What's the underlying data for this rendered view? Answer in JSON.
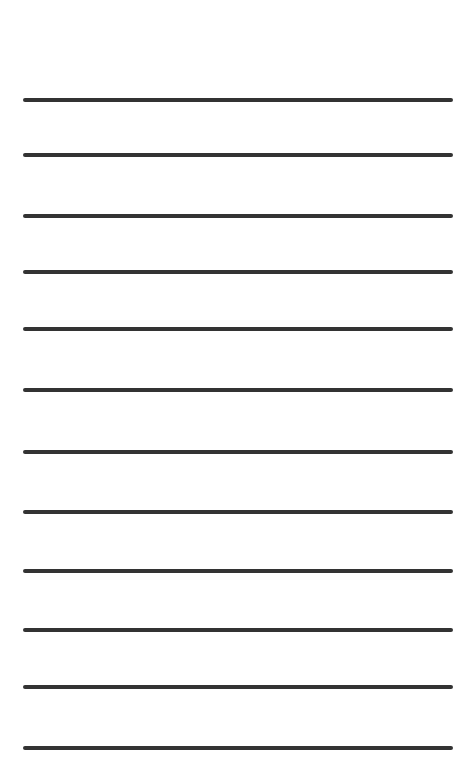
{
  "page": {
    "type": "lined-paper",
    "line_color": "#333333",
    "background_color": "#ffffff",
    "lines": [
      {
        "y": 98
      },
      {
        "y": 153
      },
      {
        "y": 214
      },
      {
        "y": 270
      },
      {
        "y": 327
      },
      {
        "y": 388
      },
      {
        "y": 450
      },
      {
        "y": 510
      },
      {
        "y": 569
      },
      {
        "y": 628
      },
      {
        "y": 685
      },
      {
        "y": 746
      }
    ]
  }
}
